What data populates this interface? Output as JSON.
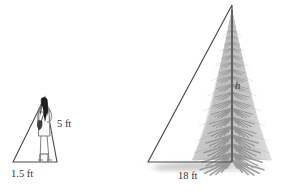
{
  "figure": {
    "background_color": "#ffffff",
    "line_color": "#3a3a3a",
    "tree_color": "#9a9a9a",
    "label_color": "#333333"
  },
  "left_scene": {
    "name": "person-and-shadow-triangle",
    "labels": {
      "height_label": "5 ft",
      "base_label": "1.5 ft"
    },
    "triangle": {
      "apex": [
        45,
        97
      ],
      "left_vertex": [
        13,
        162
      ],
      "right_vertex": [
        57,
        162
      ]
    },
    "right_angle_marker": true,
    "person": {
      "description": "woman standing upright, long dark hair, shoulder bag",
      "hair_color": "#1c1c1c",
      "outline_color": "#555555"
    }
  },
  "right_scene": {
    "name": "tree-and-shadow-triangle",
    "labels": {
      "height_label": "h",
      "base_label": "18 ft"
    },
    "triangle": {
      "apex": [
        232,
        5
      ],
      "left_vertex": [
        148,
        162
      ],
      "right_vertex": [
        232,
        162
      ]
    },
    "tree": {
      "description": "tall conifer / pine tree with feathery branches",
      "color": "#9a9a9a",
      "shadow": true
    }
  },
  "measurements": {
    "person_height": "5 ft",
    "person_shadow": "1.5 ft",
    "tree_shadow": "18 ft",
    "tree_height_unknown": "h"
  }
}
